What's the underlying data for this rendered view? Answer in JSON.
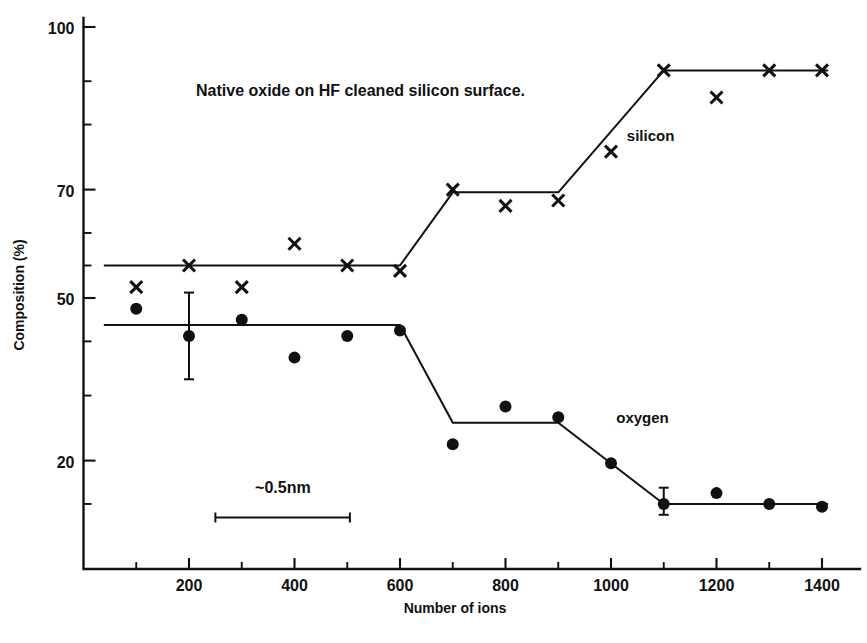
{
  "chart_data": {
    "type": "scatter",
    "title": "Native oxide on HF cleaned silicon surface.",
    "xlabel": "Number of ions",
    "ylabel": "Composition (%)",
    "xlim": [
      0,
      1450
    ],
    "ylim": [
      0,
      100
    ],
    "xticks": [
      200,
      400,
      600,
      800,
      1000,
      1200,
      1400
    ],
    "xtick_labels": [
      "200",
      "400",
      "600",
      "800",
      "1000",
      "1200",
      "1400"
    ],
    "xminor_ticks": [
      100,
      300,
      500,
      700,
      900,
      1100,
      1300
    ],
    "yticks": [
      100,
      70,
      50,
      20
    ],
    "ytick_labels": [
      "100",
      "70",
      "50",
      "20"
    ],
    "yminor_ticks": [
      90,
      82,
      62,
      56,
      42,
      32,
      12
    ],
    "grid": false,
    "legend_position": "inline-annotations",
    "series": [
      {
        "name": "silicon",
        "marker": "x",
        "label_text": "silicon",
        "label_x": 1030,
        "label_y": 79,
        "points": [
          {
            "x": 100,
            "y": 52
          },
          {
            "x": 200,
            "y": 56
          },
          {
            "x": 300,
            "y": 52
          },
          {
            "x": 400,
            "y": 60
          },
          {
            "x": 500,
            "y": 56
          },
          {
            "x": 600,
            "y": 55
          },
          {
            "x": 700,
            "y": 70
          },
          {
            "x": 800,
            "y": 67
          },
          {
            "x": 900,
            "y": 68
          },
          {
            "x": 1000,
            "y": 77
          },
          {
            "x": 1100,
            "y": 92
          },
          {
            "x": 1200,
            "y": 87
          },
          {
            "x": 1300,
            "y": 92
          },
          {
            "x": 1400,
            "y": 92
          }
        ],
        "trend": [
          {
            "x": 40,
            "y": 56
          },
          {
            "x": 600,
            "y": 56
          },
          {
            "x": 700,
            "y": 69.5
          },
          {
            "x": 900,
            "y": 69.5
          },
          {
            "x": 1100,
            "y": 92
          },
          {
            "x": 1410,
            "y": 92
          }
        ]
      },
      {
        "name": "oxygen",
        "marker": "circle",
        "label_text": "oxygen",
        "label_x": 1010,
        "label_y": 27,
        "points": [
          {
            "x": 100,
            "y": 48
          },
          {
            "x": 200,
            "y": 43,
            "err_low": 35,
            "err_high": 51
          },
          {
            "x": 300,
            "y": 46
          },
          {
            "x": 400,
            "y": 39
          },
          {
            "x": 500,
            "y": 43
          },
          {
            "x": 600,
            "y": 44
          },
          {
            "x": 700,
            "y": 23
          },
          {
            "x": 800,
            "y": 30
          },
          {
            "x": 900,
            "y": 28
          },
          {
            "x": 1000,
            "y": 19.5
          },
          {
            "x": 1100,
            "y": 12,
            "err_low": 10,
            "err_high": 15
          },
          {
            "x": 1200,
            "y": 14
          },
          {
            "x": 1300,
            "y": 12
          },
          {
            "x": 1400,
            "y": 11.5
          }
        ],
        "trend": [
          {
            "x": 40,
            "y": 45
          },
          {
            "x": 600,
            "y": 45
          },
          {
            "x": 700,
            "y": 27
          },
          {
            "x": 900,
            "y": 27
          },
          {
            "x": 1100,
            "y": 12
          },
          {
            "x": 1410,
            "y": 12
          }
        ]
      }
    ],
    "annotations": [
      {
        "name": "scale-bar",
        "text": "~0.5nm",
        "x_start": 250,
        "x_end": 505,
        "y": 9.5,
        "text_x": 378,
        "text_y": 14
      }
    ]
  }
}
